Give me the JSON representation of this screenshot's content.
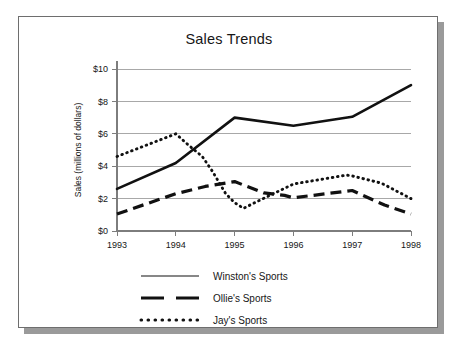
{
  "chart_data": {
    "type": "line",
    "title": "Sales Trends",
    "xlabel": "",
    "ylabel": "Sales (millions of dollars)",
    "x": [
      1993,
      1994,
      1995,
      1996,
      1997,
      1998
    ],
    "xtick_labels": [
      "1993",
      "1994",
      "1995",
      "1996",
      "1997",
      "1998"
    ],
    "ytick_labels": [
      "$0",
      "$2",
      "$4",
      "$6",
      "$8",
      "$10"
    ],
    "ytick_values": [
      0,
      2,
      4,
      6,
      8,
      10
    ],
    "ylim": [
      0,
      10
    ],
    "xlim": [
      1993,
      1998
    ],
    "grid": "horizontal",
    "legend_position": "bottom",
    "series": [
      {
        "name": "Winston's Sports",
        "style": "solid",
        "values": [
          2.6,
          4.2,
          7.0,
          6.5,
          7.05,
          9.0
        ]
      },
      {
        "name": "Ollie's Sports",
        "style": "dashed",
        "values": [
          1.05,
          2.3,
          3.05,
          2.05,
          2.5,
          1.05
        ],
        "extra_points": [
          {
            "x": 1994.5,
            "y": 2.75
          },
          {
            "x": 1995.5,
            "y": 2.35
          },
          {
            "x": 1995.85,
            "y": 2.2
          },
          {
            "x": 1997.55,
            "y": 1.6
          }
        ]
      },
      {
        "name": "Jay's Sports",
        "style": "dotted",
        "values": [
          4.6,
          6.0,
          1.75,
          2.9,
          3.4,
          2.0
        ],
        "extra_points": [
          {
            "x": 1994.2,
            "y": 5.35
          },
          {
            "x": 1994.45,
            "y": 4.6
          },
          {
            "x": 1994.62,
            "y": 3.7
          },
          {
            "x": 1994.85,
            "y": 2.3
          },
          {
            "x": 1995.15,
            "y": 1.4
          },
          {
            "x": 1995.4,
            "y": 1.85
          },
          {
            "x": 1996.9,
            "y": 3.45
          },
          {
            "x": 1997.5,
            "y": 2.95
          }
        ]
      }
    ]
  },
  "legend": {
    "items": [
      {
        "label": "Winston's Sports",
        "key": "solid-line-key"
      },
      {
        "label": "Ollie's Sports",
        "key": "dashed-line-key"
      },
      {
        "label": "Jay's Sports",
        "key": "dotted-line-key"
      }
    ]
  },
  "colors": {
    "ink": "#111111",
    "grid": "#a8a8a8",
    "axis": "#7d7d7d",
    "card_border": "#6e6e6e",
    "shadow": "#9a9a9a",
    "background": "#ffffff"
  }
}
